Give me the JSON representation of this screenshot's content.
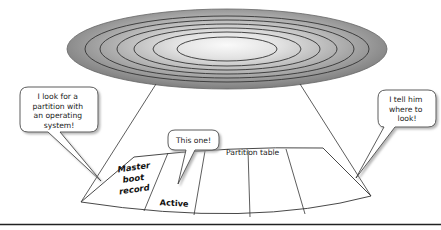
{
  "diagram": {
    "disk": {
      "name": "hard disk platter",
      "track_count": 6,
      "fill_color": "#8f8f8f",
      "center_color": "#f4f4f4"
    },
    "bubbles": {
      "left": {
        "lines": [
          "I look for a",
          "partition with",
          "an operating",
          "system!"
        ]
      },
      "right": {
        "lines": [
          "I tell him",
          "where to",
          "look!"
        ]
      },
      "center": {
        "text": "This one!"
      }
    },
    "table": {
      "label": "Partition table",
      "cells": [
        {
          "lines": [
            "Master",
            "boot",
            "record"
          ]
        },
        {
          "text": "Active"
        },
        {
          "text": ""
        },
        {
          "text": ""
        },
        {
          "text": ""
        }
      ]
    },
    "colors": {
      "line": "#333333",
      "bubble_fill": "#ffffff",
      "bubble_shadow": "#bdbdbd",
      "baseline": "#222222"
    }
  }
}
